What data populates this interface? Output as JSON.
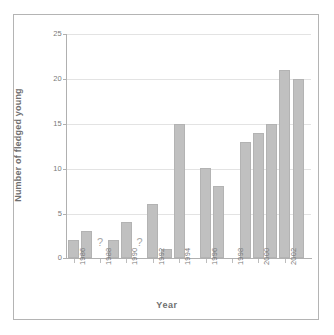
{
  "chart_data": {
    "type": "bar",
    "title": "",
    "xlabel": "Year",
    "ylabel": "Number of fledged young",
    "ylim": [
      0,
      25
    ],
    "yticks": [
      0,
      5,
      10,
      15,
      20,
      25
    ],
    "ytick_labels": [
      "0",
      "5",
      "10",
      "15",
      "20",
      "25"
    ],
    "grid": true,
    "legend": "none",
    "xtick_labels": [
      "1986",
      "1988",
      "1990",
      "1992",
      "1994",
      "1996",
      "1998",
      "2000",
      "2002"
    ],
    "categories": [
      "1986",
      "1987",
      "1988",
      "1989",
      "1990",
      "1991",
      "1992",
      "1993",
      "1994",
      "1995",
      "1996",
      "1997",
      "1998",
      "1999",
      "2000",
      "2001",
      "2002",
      "2003"
    ],
    "values": [
      2,
      3,
      null,
      2,
      4,
      null,
      6,
      1,
      15,
      null,
      10,
      8,
      null,
      13,
      14,
      15,
      21,
      20
    ],
    "missing_marker": "?",
    "missing_marker_years": [
      "1988",
      "1991"
    ],
    "bar_color": "#c0c0c0",
    "bar_edge_color": "#b3b3b3",
    "gridline_color": "#e3e3e3",
    "axis_color": "#b0b0b0",
    "tick_text_color": "#7a7a7a",
    "axis_title_color": "#6e6e6e",
    "background_color": "#ffffff",
    "frame_color": "#b4b4b4"
  }
}
